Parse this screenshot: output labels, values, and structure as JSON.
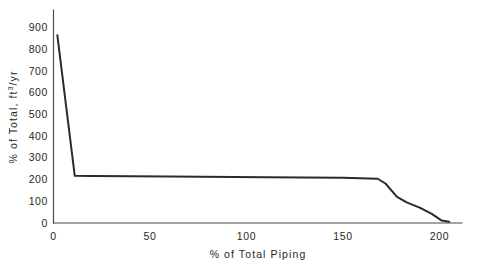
{
  "chart_data": {
    "type": "line",
    "title": "",
    "xlabel": "% of Total Piping",
    "ylabel": "% of Total, ft³/yr",
    "ylabel_prefix": "% of Total, ft",
    "ylabel_superscript": "3",
    "ylabel_suffix": "/yr",
    "xlim": [
      0,
      207
    ],
    "ylim": [
      0,
      940
    ],
    "xticks": [
      0,
      50,
      100,
      150,
      200
    ],
    "xtick_labels": [
      "0",
      "50",
      "100",
      "150",
      "200"
    ],
    "yticks": [
      0,
      100,
      200,
      300,
      400,
      500,
      600,
      700,
      800,
      900
    ],
    "ytick_labels": [
      "0",
      "100",
      "200",
      "300",
      "400",
      "500",
      "600",
      "700",
      "800",
      "900"
    ],
    "grid": false,
    "legend": false,
    "series": [
      {
        "name": "Piping volume distribution",
        "color": "#2b2b2b",
        "x": [
          2,
          11,
          20,
          60,
          110,
          150,
          168,
          172,
          178,
          183,
          190,
          196,
          201,
          205
        ],
        "values": [
          865,
          218,
          216,
          214,
          211,
          208,
          204,
          182,
          120,
          95,
          70,
          42,
          12,
          6
        ]
      }
    ]
  },
  "colors": {
    "line": "#2b2b2b",
    "axis": "#4a4a4a",
    "text": "#272727",
    "background": "#ffffff"
  }
}
